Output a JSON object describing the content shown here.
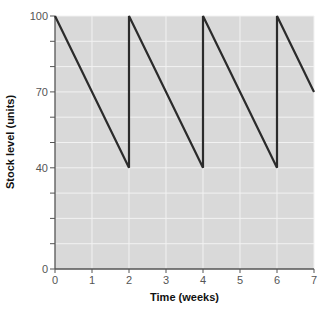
{
  "chart_data": {
    "type": "line",
    "title": "",
    "xlabel": "Time (weeks)",
    "ylabel": "Stock level (units)",
    "xlim": [
      0,
      7
    ],
    "ylim": [
      0,
      100
    ],
    "x_ticks": [
      "0",
      "1",
      "2",
      "3",
      "4",
      "5",
      "6",
      "7"
    ],
    "y_ticks": [
      "0",
      "40",
      "70",
      "100"
    ],
    "y_minor_ticks": [
      10,
      20,
      30,
      50,
      60,
      80,
      90
    ],
    "grid": true,
    "legend": null,
    "series": [
      {
        "name": "Stock level",
        "points": [
          [
            0,
            100
          ],
          [
            2,
            40
          ],
          [
            2,
            100
          ],
          [
            4,
            40
          ],
          [
            4,
            100
          ],
          [
            6,
            40
          ],
          [
            6,
            100
          ],
          [
            7,
            70
          ]
        ]
      }
    ]
  },
  "colors": {
    "plot_background": "#d9d9d9",
    "gridline": "#f2f2f2",
    "line": "#2b2b2b",
    "axis": "#555555"
  }
}
